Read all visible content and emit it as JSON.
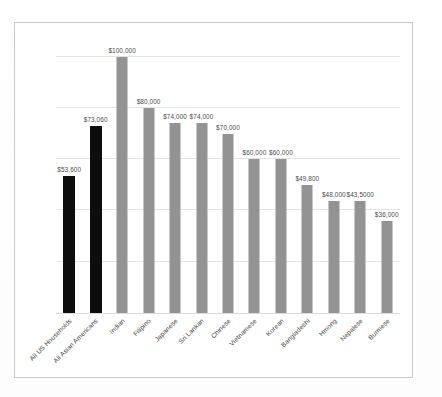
{
  "chart_data": {
    "type": "bar",
    "title": "",
    "subtitle": "",
    "xlabel": "",
    "ylabel": "",
    "ylim": [
      0,
      110000
    ],
    "grid": true,
    "gridlines": [
      20000,
      40000,
      60000,
      80000,
      100000
    ],
    "legend": "none",
    "categories": [
      "All US Households",
      "All Asian Americans",
      "Indian",
      "Filipino",
      "Japanese",
      "Sri Lankan",
      "Chinese",
      "Vietnamese",
      "Korean",
      "Bangladeshi",
      "Hmong",
      "Nepalese",
      "Burmese"
    ],
    "values": [
      53600,
      73060,
      100000,
      80000,
      74000,
      74000,
      70000,
      60000,
      60000,
      49800,
      43500,
      43500,
      36000
    ],
    "data_labels": [
      "$53,600",
      "$73,060",
      "$100,000",
      "$80,000",
      "$74,000",
      "$74,000",
      "$70,000",
      "$60,000",
      "$60,000",
      "$49,800",
      "$48,000",
      "$43,5000",
      "$36,000"
    ],
    "bar_colors": [
      "#0d0d0d",
      "#0d0d0d",
      "#939393",
      "#939393",
      "#939393",
      "#939393",
      "#939393",
      "#939393",
      "#939393",
      "#939393",
      "#939393",
      "#939393",
      "#939393"
    ],
    "highlight_color": "#0d0d0d",
    "series_color": "#939393",
    "grid_color": "#e3e3e3",
    "frame_color": "#c9c9c9"
  },
  "caption": {
    "text": ""
  }
}
